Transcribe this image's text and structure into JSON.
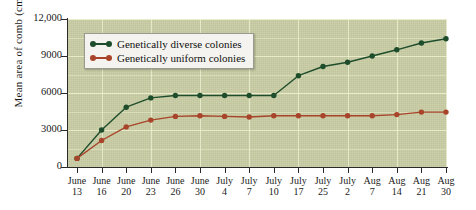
{
  "axes": {
    "ylabel": "Mean area of comb (cm",
    "ylabel_sup": "2",
    "ylabel_close": ")",
    "yticks": [
      "12,000",
      "9000",
      "6000",
      "3000",
      "0"
    ],
    "ylim": [
      0,
      12000
    ],
    "xticks_month": [
      "June",
      "June",
      "June",
      "June",
      "June",
      "June",
      "July",
      "July",
      "July",
      "July",
      "July",
      "July",
      "Aug",
      "Aug",
      "Aug",
      "Aug",
      "Aug"
    ],
    "xticks_day": [
      "13",
      "16",
      "20",
      "23",
      "26",
      "30",
      "4",
      "7",
      "10",
      "17",
      "25",
      "2",
      "7",
      "14",
      "21",
      "30"
    ]
  },
  "legend": {
    "items": [
      {
        "label": "Genetically diverse colonies",
        "color": "#1e4d2b"
      },
      {
        "label": "Genetically uniform colonies",
        "color": "#a8442a"
      }
    ]
  },
  "colors": {
    "plot_background": "#c8cda4",
    "gridline": "#eef0cf",
    "axis": "#2a2a2a",
    "diverse": "#1e4d2b",
    "uniform": "#a8442a",
    "legend_background": "#f4f3ef"
  },
  "chart_data": {
    "type": "line",
    "title": "",
    "xlabel": "",
    "ylabel": "Mean area of comb (cm2)",
    "ylim": [
      0,
      12000
    ],
    "yticks": [
      0,
      3000,
      6000,
      9000,
      12000
    ],
    "grid": true,
    "legend_position": "upper-left-inset",
    "categories": [
      "June 13",
      "June 16",
      "June 20",
      "June 23",
      "June 26",
      "June 30",
      "July 4",
      "July 7",
      "July 10",
      "July 17",
      "July 25",
      "Aug 2",
      "Aug 7",
      "Aug 14",
      "Aug 21",
      "Aug 30"
    ],
    "series": [
      {
        "name": "Genetically diverse colonies",
        "color": "#1e4d2b",
        "values": [
          700,
          3000,
          4850,
          5600,
          5800,
          5800,
          5800,
          5800,
          5800,
          7400,
          8150,
          8500,
          9000,
          9500,
          10050,
          10400
        ]
      },
      {
        "name": "Genetically uniform colonies",
        "color": "#a8442a",
        "values": [
          700,
          2150,
          3250,
          3800,
          4100,
          4150,
          4100,
          4050,
          4150,
          4150,
          4150,
          4150,
          4150,
          4250,
          4450,
          4450
        ]
      }
    ]
  }
}
